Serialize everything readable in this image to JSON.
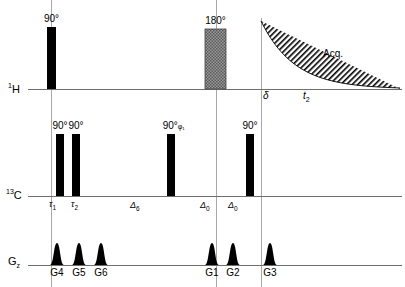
{
  "figure": {
    "type": "nmr-pulse-sequence-diagram",
    "width": 405,
    "height": 287,
    "background": "#ffffff",
    "ink": "#000000",
    "axis_color": "#808080",
    "guide_color": "#a8a8a8",
    "hatch_180_fill": "#8c8c8c"
  },
  "channels": [
    {
      "id": "h1",
      "label_html": "<sup>1</sup>H",
      "label_text": "1H",
      "baseline_y": 89
    },
    {
      "id": "c13",
      "label_html": "<sup>13</sup>C",
      "label_text": "13C",
      "baseline_y": 196
    },
    {
      "id": "gz",
      "label_html": "G<sub>z</sub>",
      "label_text": "Gz",
      "baseline_y": 265
    }
  ],
  "h1_pulses": [
    {
      "name": "h1-90-pulse",
      "label": "90°",
      "x": 47,
      "width": 9,
      "height": 62,
      "style": "solid"
    },
    {
      "name": "h1-180-pulse",
      "label": "180°",
      "x": 205,
      "width": 21,
      "height": 60,
      "style": "hatched"
    }
  ],
  "c13_pulses": [
    {
      "name": "c13-90-pulse-1",
      "label": "90°",
      "phase": "",
      "x": 56,
      "width": 8,
      "height": 62
    },
    {
      "name": "c13-90-pulse-2",
      "label": "90°",
      "phase": "",
      "x": 72,
      "width": 8,
      "height": 62
    },
    {
      "name": "c13-90-pulse-phi1",
      "label": "90°",
      "phase": "φ₁",
      "x": 167,
      "width": 8,
      "height": 62
    },
    {
      "name": "c13-90-pulse-4",
      "label": "90°",
      "phase": "",
      "x": 246,
      "width": 8,
      "height": 62
    }
  ],
  "c13_delays": [
    {
      "name": "delay-tau1",
      "sym": "τ",
      "sub": "1",
      "x": 49,
      "y": 200
    },
    {
      "name": "delay-tau2",
      "sym": "τ",
      "sub": "2",
      "x": 71,
      "y": 200
    },
    {
      "name": "delay-delta6",
      "sym": "Δ",
      "sub": "6",
      "x": 130,
      "y": 201
    },
    {
      "name": "delay-delta0-a",
      "sym": "Δ",
      "sub": "0",
      "x": 200,
      "y": 201
    },
    {
      "name": "delay-delta0-b",
      "sym": "Δ",
      "sub": "0",
      "x": 228,
      "y": 201
    }
  ],
  "gradients": [
    {
      "name": "gradient-g4",
      "label": "G4",
      "cx": 57,
      "width": 14,
      "height": 22
    },
    {
      "name": "gradient-g5",
      "label": "G5",
      "cx": 79,
      "width": 14,
      "height": 22
    },
    {
      "name": "gradient-g6",
      "label": "G6",
      "cx": 101,
      "width": 14,
      "height": 22
    },
    {
      "name": "gradient-g1",
      "label": "G1",
      "cx": 212,
      "width": 14,
      "height": 22
    },
    {
      "name": "gradient-g2",
      "label": "G2",
      "cx": 233,
      "width": 14,
      "height": 22
    },
    {
      "name": "gradient-g3",
      "label": "G3",
      "cx": 270,
      "width": 14,
      "height": 22
    }
  ],
  "acquisition": {
    "name": "acquisition-fid",
    "label": "Acq.",
    "label_x": 323,
    "label_y": 49,
    "start_x": 261,
    "end_x": 400,
    "peak_height": 68,
    "decay": 0.03
  },
  "markers": {
    "delta": {
      "name": "delta-marker",
      "sym": "δ",
      "x": 263,
      "y": 91
    },
    "t2": {
      "name": "t2-marker",
      "sym": "t",
      "sub": "2",
      "x": 303,
      "y": 91
    }
  },
  "guides": [
    {
      "name": "guide-line-1",
      "x": 51,
      "y1": 0,
      "y2": 287
    },
    {
      "name": "guide-line-2",
      "x": 216,
      "y1": 0,
      "y2": 287
    },
    {
      "name": "guide-line-3",
      "x": 261,
      "y1": 18,
      "y2": 287
    }
  ],
  "baselines": [
    {
      "name": "baseline-h1",
      "y": 89,
      "x1": 28,
      "x2": 402
    },
    {
      "name": "baseline-c13",
      "y": 196,
      "x1": 28,
      "x2": 402
    },
    {
      "name": "baseline-gz",
      "y": 265,
      "x1": 28,
      "x2": 402
    }
  ]
}
